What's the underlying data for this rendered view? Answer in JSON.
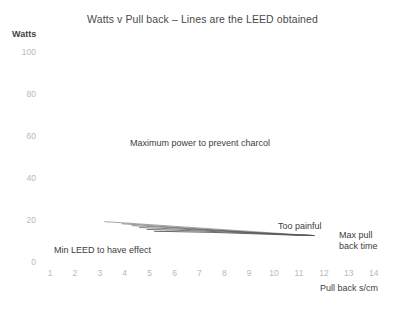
{
  "chart_data": {
    "type": "line",
    "title": "Watts v Pull back – Lines are the LEED obtained",
    "xlabel": "Pull back s/cm",
    "ylabel": "Watts",
    "xlim": [
      0,
      14.6
    ],
    "ylim": [
      0,
      105
    ],
    "grid": false,
    "legend": "none",
    "xticks": [
      "1",
      "2",
      "3",
      "4",
      "5",
      "6",
      "7",
      "8",
      "9",
      "10",
      "11",
      "12",
      "13",
      "14"
    ],
    "xtick_values": [
      1,
      2,
      3,
      4,
      5,
      6,
      7,
      8,
      9,
      10,
      11,
      12,
      13,
      14
    ],
    "yticks": [
      "0",
      "20",
      "40",
      "60",
      "80",
      "100"
    ],
    "ytick_values": [
      0,
      20,
      40,
      60,
      80,
      100
    ],
    "line_color": "#595959",
    "series": [
      {
        "name": "LEED line 1",
        "x": [
          3.2,
          4.0,
          5.0,
          6.0,
          7.0,
          8.0,
          9.0,
          10.0,
          11.0,
          11.6
        ],
        "y": [
          19.2,
          18.6,
          17.8,
          17.0,
          16.2,
          15.4,
          14.6,
          13.8,
          13.0,
          12.6
        ]
      },
      {
        "name": "LEED line 2",
        "x": [
          3.9,
          4.6,
          5.4,
          6.3,
          7.2,
          8.1,
          9.0,
          10.0,
          11.0,
          11.6
        ],
        "y": [
          18.2,
          17.7,
          17.0,
          16.3,
          15.6,
          14.9,
          14.2,
          13.5,
          12.9,
          12.6
        ]
      },
      {
        "name": "LEED line 3",
        "x": [
          4.3,
          5.0,
          5.8,
          6.6,
          7.5,
          8.4,
          9.2,
          10.1,
          11.0,
          11.6
        ],
        "y": [
          17.3,
          16.9,
          16.4,
          15.8,
          15.2,
          14.6,
          14.0,
          13.4,
          12.9,
          12.6
        ]
      },
      {
        "name": "LEED line 4",
        "x": [
          4.6,
          5.3,
          6.1,
          6.9,
          7.8,
          8.6,
          9.4,
          10.2,
          11.0,
          11.6
        ],
        "y": [
          16.4,
          16.1,
          15.7,
          15.3,
          14.8,
          14.3,
          13.8,
          13.3,
          12.8,
          12.6
        ]
      },
      {
        "name": "LEED line 5",
        "x": [
          4.9,
          5.6,
          6.4,
          7.2,
          8.0,
          8.8,
          9.6,
          10.4,
          11.1,
          11.6
        ],
        "y": [
          15.5,
          15.3,
          15.0,
          14.7,
          14.3,
          13.9,
          13.5,
          13.1,
          12.8,
          12.6
        ]
      },
      {
        "name": "LEED line 6",
        "x": [
          5.2,
          5.9,
          6.7,
          7.5,
          8.3,
          9.0,
          9.8,
          10.5,
          11.2,
          11.6
        ],
        "y": [
          14.6,
          14.5,
          14.3,
          14.1,
          13.8,
          13.5,
          13.2,
          12.9,
          12.7,
          12.6
        ]
      }
    ],
    "annotations": [
      {
        "name": "max-power-note",
        "text": "Maximum power to prevent charcol",
        "x": 130,
        "y": 138
      },
      {
        "name": "min-leed-note",
        "text": "Min LEED to have effect",
        "x": 54,
        "y": 245
      },
      {
        "name": "too-painful-note",
        "text": "Too painful",
        "x": 278,
        "y": 221
      },
      {
        "name": "max-pull-back-note-line1",
        "text": "Max pull",
        "x": 339,
        "y": 230
      },
      {
        "name": "max-pull-back-note-line2",
        "text": "back time",
        "x": 339,
        "y": 241
      }
    ]
  }
}
